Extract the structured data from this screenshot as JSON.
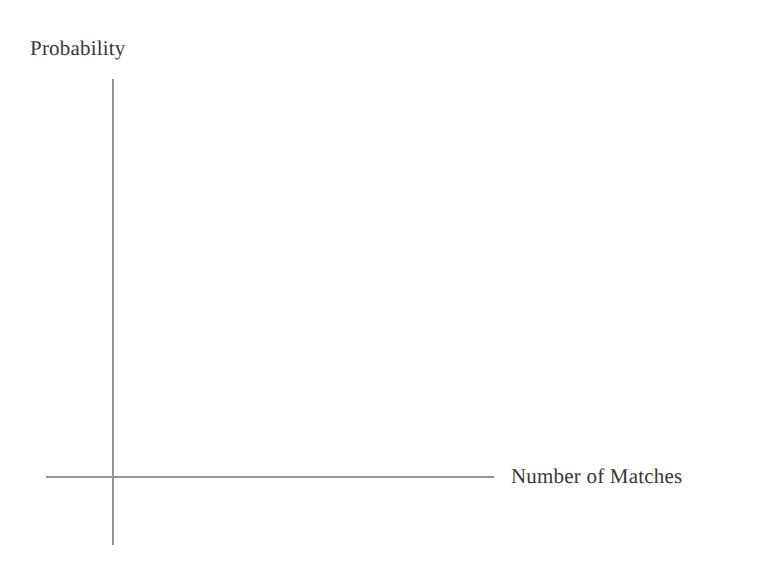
{
  "figure": {
    "kind": "blank-coordinate-axes",
    "width": 760,
    "height": 562,
    "background_color": "#ffffff",
    "description_note": "Empty axes template with no plotted data, tick marks, or gridlines"
  },
  "chart_data": {
    "type": "line",
    "title": "",
    "subtitle": "",
    "xlabel": "Number of Matches",
    "ylabel": "Probability",
    "x": [],
    "values": [],
    "series": [],
    "categories": [],
    "xtick_labels": [],
    "ytick_labels": [],
    "xlim": null,
    "ylim": null,
    "grid": false,
    "legend": false,
    "legend_position": "none",
    "annotations": [],
    "axis_color": "#8a8a8a",
    "text_color": "#3a3735"
  },
  "labels": {
    "y_axis": "Probability",
    "x_axis": "Number of Matches"
  },
  "axes": {
    "y": {
      "name": "vertical-axis",
      "x_position": 113,
      "top": 79,
      "bottom": 545,
      "color": "#8a8a8a"
    },
    "x": {
      "name": "horizontal-axis",
      "y_position": 477,
      "left": 46,
      "right": 494,
      "color": "#8a8a8a"
    },
    "origin": {
      "x": 113,
      "y": 477
    }
  }
}
